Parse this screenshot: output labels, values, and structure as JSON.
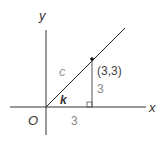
{
  "diagram": {
    "axes": {
      "x_label": "x",
      "y_label": "y",
      "origin_label": "O"
    },
    "point": {
      "label": "(3,3)",
      "x": 3,
      "y": 3
    },
    "hypotenuse_label": "c",
    "angle_label": "k",
    "base_length_label": "3",
    "height_length_label": "3",
    "colors": {
      "axis": "#333333",
      "line": "#222222",
      "label_dark": "#333333",
      "label_gray": "#888888",
      "label_light": "#999999"
    }
  }
}
